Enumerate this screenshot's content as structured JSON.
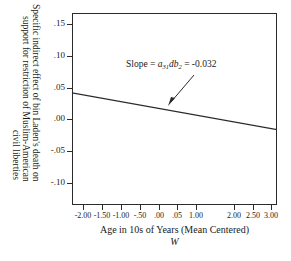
{
  "figure": {
    "title_remnant": "",
    "background_color": "#ffffff",
    "axis_color": "#2b2b2b",
    "line_color": "#2b2b2b"
  },
  "annotation": {
    "prefix": "Slope = ",
    "coef_a": "a",
    "coef_a_sub": "31",
    "coef_db": "db",
    "coef_db_sub": "2",
    "equals": " = ",
    "value": "-0.032",
    "full_text": "Slope = a31db2 = -0.032"
  },
  "axes": {
    "y_title_lines": [
      "Specific indirect effect of bin Laden's death on",
      "support for restriction of Muslim-American",
      "civil liberties"
    ],
    "x_title": "Age in 10s of Years (Mean Centered)",
    "x_moderator_symbol": "W"
  },
  "chart_data": {
    "type": "line",
    "title": "",
    "xlabel": "Age in 10s of Years (Mean Centered)",
    "ylabel": "Specific indirect effect of bin Laden's death on support for restriction of Muslim-American civil liberties",
    "xlim": [
      -2.3,
      3.15
    ],
    "ylim": [
      -0.135,
      0.168
    ],
    "grid": false,
    "legend": null,
    "x_tick_labels": [
      "-2.00",
      "-1.50",
      "-1.00",
      "-.50",
      ".00",
      ".05",
      "1.00",
      "2.00",
      "2.50",
      "3.00"
    ],
    "x_tick_values": [
      -2.0,
      -1.5,
      -1.0,
      -0.5,
      0.0,
      0.5,
      1.0,
      2.0,
      2.5,
      3.0
    ],
    "y_tick_labels": [
      ".15",
      ".10",
      ".05",
      ".00",
      "-.05",
      "-.10"
    ],
    "y_tick_values": [
      0.15,
      0.1,
      0.05,
      0.0,
      -0.05,
      -0.1
    ],
    "series": [
      {
        "name": "Specific indirect effect",
        "slope": -0.032,
        "intercept": -0.022,
        "x": [
          -2.0,
          3.0
        ],
        "values": [
          0.042,
          -0.016
        ]
      }
    ],
    "annotations": [
      {
        "text": "Slope = a31db2 = -0.032",
        "x": 0.55,
        "y": 0.108,
        "arrow_to_x": -0.08,
        "arrow_to_y": 0.048
      }
    ]
  }
}
